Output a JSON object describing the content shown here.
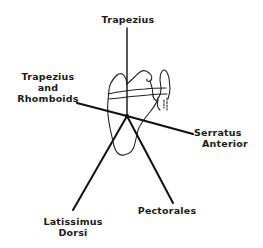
{
  "diagram": {
    "colors": {
      "line": "#111111",
      "outline": "#222222",
      "background": "#ffffff"
    },
    "labels": {
      "trapezius": {
        "lines": [
          "Trapezius"
        ]
      },
      "trapezius_rhomboids": {
        "lines": [
          "Trapezius",
          "and",
          "Rhomboids"
        ]
      },
      "serratus_anterior": {
        "lines": [
          "Serratus",
          "Anterior"
        ]
      },
      "latissimus_dorsi": {
        "lines": [
          "Latissimus",
          "Dorsi"
        ]
      },
      "pectorales": {
        "lines": [
          "Pectorales"
        ]
      }
    }
  }
}
